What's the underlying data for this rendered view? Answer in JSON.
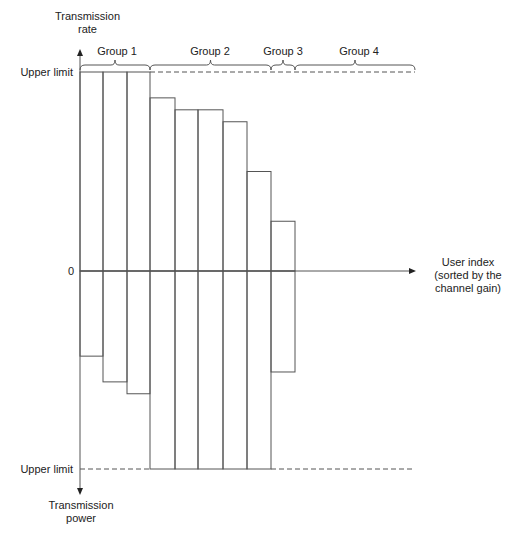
{
  "labels": {
    "y_up": [
      "Transmission",
      "rate"
    ],
    "y_down": [
      "Transmission",
      "power"
    ],
    "upper_limit_top": "Upper limit",
    "upper_limit_bottom": "Upper limit",
    "zero": "0",
    "x_axis": [
      "User index",
      "(sorted by the",
      "channel gain)"
    ]
  },
  "groups": [
    {
      "label": "Group 1",
      "from_bar": 0,
      "to_bar": 2
    },
    {
      "label": "Group 2",
      "from_bar": 3,
      "to_bar": 7
    },
    {
      "label": "Group 3",
      "from_bar": 8,
      "to_bar": 8
    },
    {
      "label": "Group 4",
      "from_bar": 9,
      "to_bar": 13
    }
  ],
  "colors": {
    "line": "#555555",
    "text": "#222222",
    "background": "#ffffff"
  },
  "geometry": {
    "zero_y": 271,
    "rate_limit_y": 72,
    "power_limit_y": 469,
    "bar_edges_x": [
      80,
      103,
      127,
      150,
      175,
      198,
      223,
      247,
      271,
      295
    ],
    "axis_right_x": 415
  },
  "chart_data": {
    "type": "bar",
    "title": "",
    "xlabel": "User index (sorted by the channel gain)",
    "ylabel_up": "Transmission rate",
    "ylabel_down": "Transmission power",
    "categories": [
      "U1",
      "U2",
      "U3",
      "U4",
      "U5",
      "U6",
      "U7",
      "U8",
      "U9"
    ],
    "series": [
      {
        "name": "Transmission rate (fraction of upper limit)",
        "values": [
          1.0,
          1.0,
          1.0,
          0.87,
          0.81,
          0.81,
          0.75,
          0.5,
          0.25
        ]
      },
      {
        "name": "Transmission power (fraction of upper limit)",
        "values": [
          0.43,
          0.56,
          0.62,
          1.0,
          1.0,
          1.0,
          1.0,
          1.0,
          0.51
        ]
      }
    ],
    "annotations": [
      "Upper limit (rate)",
      "Upper limit (power)",
      "Group 1",
      "Group 2",
      "Group 3",
      "Group 4"
    ]
  }
}
